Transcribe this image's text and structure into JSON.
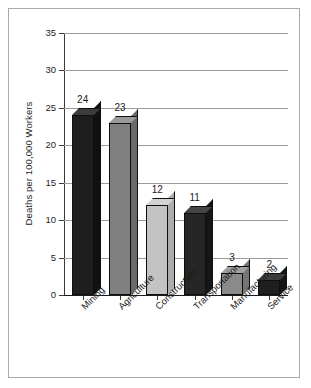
{
  "chart_data": {
    "type": "bar",
    "title": "",
    "subtitle": "",
    "xlabel": "",
    "ylabel": "Deaths per 100,000 Workers",
    "categories": [
      "Mining",
      "Agriculture",
      "Construction",
      "Transportation",
      "Manufacturing",
      "Service"
    ],
    "values": [
      24,
      23,
      12,
      11,
      3,
      2
    ],
    "data_labels": [
      "24",
      "23",
      "12",
      "11",
      "3",
      "2"
    ],
    "ylim": [
      0,
      35
    ],
    "yticks": [
      0,
      5,
      10,
      15,
      20,
      25,
      30,
      35
    ],
    "ytick_labels": [
      "0",
      "5",
      "10",
      "15",
      "20",
      "25",
      "30",
      "35"
    ],
    "grid": true,
    "grid_axis": "y",
    "legend": false,
    "legend_position": "none",
    "bar_style": "3d-block",
    "bar_colors": [
      "#1e1e1e",
      "#808080",
      "#c3c3c3",
      "#262626",
      "#8a8a8a",
      "#1f1f1f"
    ],
    "bar_top_colors": [
      "#3c3c3c",
      "#9a9a9a",
      "#d2d2d2",
      "#454545",
      "#a2a2a2",
      "#3c3c3c"
    ],
    "bar_side_colors": [
      "#101010",
      "#6a6a6a",
      "#adadad",
      "#161616",
      "#767676",
      "#141414"
    ],
    "axis_color": "#1c1c1c",
    "grid_color": "#9b9b9b",
    "background_color": "#ffffff",
    "frame_color": "#a9a9a9"
  }
}
